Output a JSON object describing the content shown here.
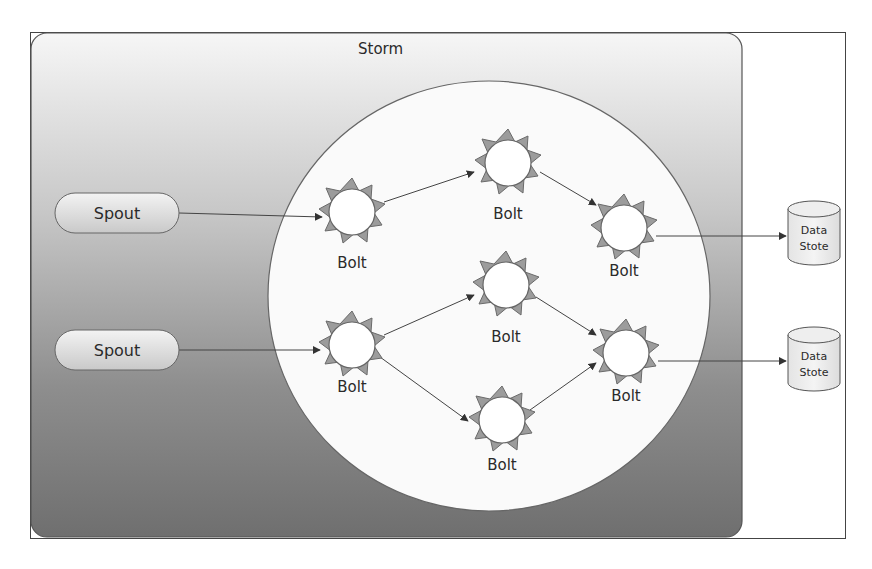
{
  "diagram": {
    "title": "Storm",
    "spouts": [
      {
        "id": "spout1",
        "label": "Spout"
      },
      {
        "id": "spout2",
        "label": "Spout"
      }
    ],
    "bolts": [
      {
        "id": "b1",
        "label": "Bolt"
      },
      {
        "id": "b2",
        "label": "Bolt"
      },
      {
        "id": "b3",
        "label": "Bolt"
      },
      {
        "id": "b4",
        "label": "Bolt"
      },
      {
        "id": "b5",
        "label": "Bolt"
      },
      {
        "id": "b6",
        "label": "Bolt"
      },
      {
        "id": "b7",
        "label": "Bolt"
      }
    ],
    "data_stores": [
      {
        "id": "ds1",
        "line1": "Data",
        "line2": "Stote"
      },
      {
        "id": "ds2",
        "line1": "Data",
        "line2": "Stote"
      }
    ],
    "edges": [
      [
        "spout1",
        "b1"
      ],
      [
        "b1",
        "b2"
      ],
      [
        "b2",
        "b3"
      ],
      [
        "b3",
        "ds1"
      ],
      [
        "spout2",
        "b4"
      ],
      [
        "b4",
        "b5"
      ],
      [
        "b4",
        "b7"
      ],
      [
        "b5",
        "b6"
      ],
      [
        "b7",
        "b6"
      ],
      [
        "b6",
        "ds2"
      ]
    ],
    "colors": {
      "storm_top": "#f4f4f4",
      "storm_bottom": "#777777",
      "circle_fill": "#f7f7f7",
      "bolt_ray": "#9a9a9a",
      "outline": "#555555"
    }
  }
}
